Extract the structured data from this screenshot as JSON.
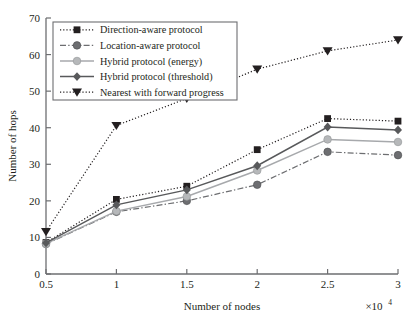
{
  "chart_data": {
    "type": "line",
    "title": "",
    "xlabel": "Number of nodes",
    "ylabel": "Number of hops",
    "x_multiplier": "×10",
    "x_multiplier_exp": "4",
    "x": [
      0.5,
      1,
      1.5,
      2,
      2.5,
      3
    ],
    "xtick_labels": [
      "0.5",
      "1",
      "1.5",
      "2",
      "2.5",
      "3"
    ],
    "ytick_labels": [
      "0",
      "10",
      "20",
      "30",
      "40",
      "50",
      "60",
      "70"
    ],
    "xlim": [
      0.5,
      3
    ],
    "ylim": [
      0,
      70
    ],
    "grid": false,
    "legend_position": "upper-left-inset",
    "series": [
      {
        "name": "Direction-aware protocol",
        "marker": "square",
        "line_style": "dotted",
        "color": "#231f20",
        "values": [
          8.6,
          20.4,
          24.0,
          34.0,
          42.5,
          41.8
        ]
      },
      {
        "name": "Location-aware protocol",
        "marker": "circle",
        "line_style": "dash-dot",
        "color": "#6d6e71",
        "values": [
          8.2,
          17.0,
          20.0,
          24.4,
          33.4,
          32.5
        ]
      },
      {
        "name": "Hybrid protocol (energy)",
        "marker": "circle-light",
        "line_style": "solid",
        "color": "#a7a9ac",
        "values": [
          8.3,
          17.2,
          21.2,
          28.3,
          36.8,
          36.1
        ]
      },
      {
        "name": "Hybrid protocol (threshold)",
        "marker": "diamond",
        "line_style": "solid",
        "color": "#58595b",
        "values": [
          8.5,
          18.9,
          23.0,
          29.6,
          40.2,
          39.4
        ]
      },
      {
        "name": "Nearest with forward progress",
        "marker": "triangle-down",
        "line_style": "dotted",
        "color": "#231f20",
        "values": [
          11.6,
          40.6,
          48.0,
          56.0,
          61.0,
          64.0
        ]
      }
    ]
  }
}
